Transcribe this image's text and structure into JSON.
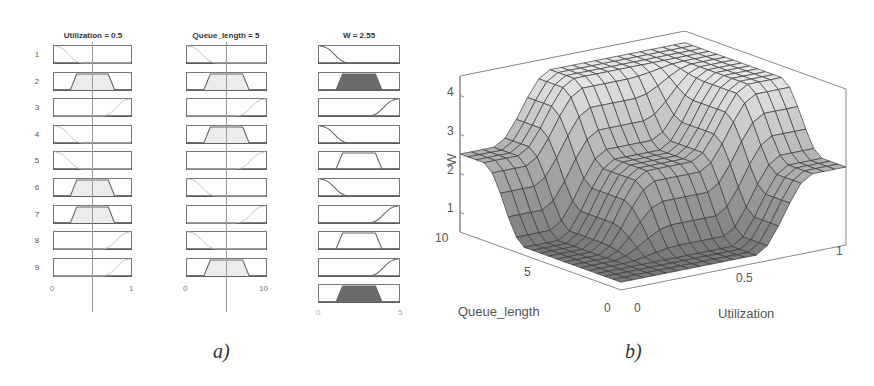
{
  "panel_a": {
    "caption": "a)",
    "columns": [
      {
        "title": "Utilization = 0.5",
        "axis_min": "0",
        "axis_max": "1"
      },
      {
        "title": "Queue_length = 5",
        "axis_min": "0",
        "axis_max": "10"
      },
      {
        "title": "W = 2.55",
        "axis_min": "0",
        "axis_max": "5"
      }
    ],
    "rule_numbers": [
      "1",
      "2",
      "3",
      "4",
      "5",
      "6",
      "7",
      "8",
      "9"
    ],
    "rules": [
      {
        "util": "low",
        "queue": "low",
        "w": "low"
      },
      {
        "util": "med",
        "queue": "med",
        "w": "med"
      },
      {
        "util": "high",
        "queue": "high",
        "w": "high"
      },
      {
        "util": "low",
        "queue": "med",
        "w": "low"
      },
      {
        "util": "low",
        "queue": "high",
        "w": "med"
      },
      {
        "util": "med",
        "queue": "low",
        "w": "low"
      },
      {
        "util": "med",
        "queue": "high",
        "w": "high"
      },
      {
        "util": "high",
        "queue": "low",
        "w": "med"
      },
      {
        "util": "high",
        "queue": "med",
        "w": "high"
      }
    ]
  },
  "panel_b": {
    "caption": "b)",
    "z_label": "W",
    "x_label": "Utilization",
    "y_label": "Queue_length",
    "z_ticks": [
      "1",
      "2",
      "3",
      "4"
    ],
    "x_ticks": [
      "0",
      "0.5",
      "1"
    ],
    "y_ticks": [
      "0",
      "5",
      "10"
    ]
  },
  "chart_data": [
    {
      "type": "table",
      "title": "Fuzzy rule viewer",
      "inputs": [
        {
          "name": "Utilization",
          "value": 0.5,
          "range": [
            0,
            1
          ]
        },
        {
          "name": "Queue_length",
          "value": 5,
          "range": [
            0,
            10
          ]
        }
      ],
      "output": {
        "name": "W",
        "value": 2.55,
        "range": [
          0,
          5
        ]
      },
      "rules": 9
    },
    {
      "type": "surface",
      "title": "Control surface W(Utilization, Queue_length)",
      "xlabel": "Utilization",
      "ylabel": "Queue_length",
      "zlabel": "W",
      "xlim": [
        0,
        1
      ],
      "ylim": [
        0,
        10
      ],
      "zlim": [
        0.5,
        4.5
      ],
      "x_ticks": [
        0,
        0.5,
        1
      ],
      "y_ticks": [
        0,
        5,
        10
      ],
      "z_ticks": [
        1,
        2,
        3,
        4
      ],
      "notes": "Plateau ~4.2 at high util/queue, step ~2.5 along edges, minimum ~0.7 near origin"
    }
  ]
}
